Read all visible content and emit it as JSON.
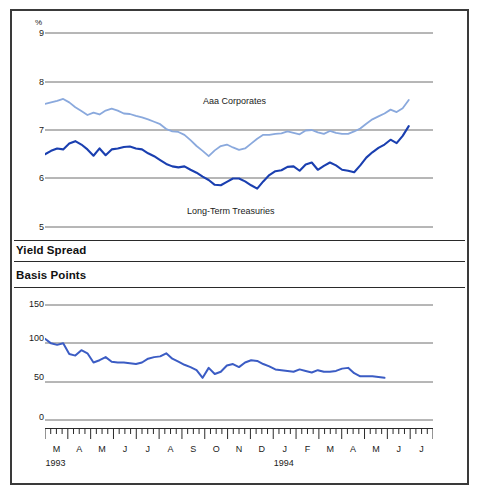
{
  "figure": {
    "background": "#ffffff",
    "frame_color": "#3a3a3a"
  },
  "sections": {
    "yield_spread_heading": "Yield Spread",
    "basis_points_heading": "Basis Points"
  },
  "chart_data": [
    {
      "id": "yields",
      "type": "line",
      "title": "",
      "xlabel": "",
      "ylabel": "%",
      "ylim": [
        5,
        9
      ],
      "yticks": [
        5,
        6,
        7,
        8,
        9
      ],
      "ytick_labels": [
        "5",
        "6",
        "7",
        "8",
        "9"
      ],
      "grid": true,
      "legend_position": "in-plot",
      "xlim": [
        0,
        64
      ],
      "annotations": [
        {
          "text": "Aaa Corporates",
          "x": 25.0,
          "y": 7.62
        },
        {
          "text": "Long-Term Treasuries",
          "x": 25.0,
          "y": 5.38
        }
      ],
      "series": [
        {
          "name": "Aaa Corporates",
          "color": "#8aa9dd",
          "values": [
            7.54,
            7.57,
            7.6,
            7.64,
            7.57,
            7.47,
            7.39,
            7.31,
            7.36,
            7.32,
            7.4,
            7.44,
            7.4,
            7.34,
            7.33,
            7.29,
            7.26,
            7.22,
            7.17,
            7.12,
            7.02,
            6.97,
            6.96,
            6.9,
            6.79,
            6.67,
            6.57,
            6.46,
            6.58,
            6.67,
            6.7,
            6.64,
            6.59,
            6.62,
            6.72,
            6.82,
            6.9,
            6.9,
            6.92,
            6.93,
            6.97,
            6.94,
            6.91,
            6.99,
            7.0,
            6.95,
            6.92,
            6.98,
            6.94,
            6.92,
            6.92,
            6.97,
            7.03,
            7.13,
            7.22,
            7.28,
            7.34,
            7.42,
            7.37,
            7.45,
            7.62
          ]
        },
        {
          "name": "Long-Term Treasuries",
          "color": "#1a3fb0",
          "values": [
            6.5,
            6.57,
            6.62,
            6.6,
            6.72,
            6.77,
            6.7,
            6.6,
            6.47,
            6.62,
            6.48,
            6.6,
            6.62,
            6.65,
            6.66,
            6.62,
            6.6,
            6.52,
            6.46,
            6.38,
            6.3,
            6.25,
            6.23,
            6.25,
            6.18,
            6.12,
            6.04,
            5.97,
            5.87,
            5.86,
            5.93,
            6.0,
            6.0,
            5.94,
            5.86,
            5.79,
            5.94,
            6.07,
            6.15,
            6.17,
            6.24,
            6.25,
            6.16,
            6.29,
            6.33,
            6.18,
            6.26,
            6.33,
            6.27,
            6.18,
            6.16,
            6.13,
            6.27,
            6.43,
            6.54,
            6.63,
            6.7,
            6.8,
            6.73,
            6.88,
            7.08
          ]
        }
      ]
    },
    {
      "id": "yield-spread",
      "type": "line",
      "title": "Basis Points",
      "xlabel": "",
      "ylabel": "Basis Points",
      "ylim": [
        0,
        150
      ],
      "yticks": [
        0,
        50,
        100,
        150
      ],
      "ytick_labels": [
        "0",
        "50",
        "100",
        "150"
      ],
      "grid": true,
      "xlim": [
        0,
        64
      ],
      "series": [
        {
          "name": "Yield Spread",
          "color": "#3b5cc4",
          "values": [
            106,
            100,
            98,
            100,
            86,
            84,
            91,
            87,
            75,
            78,
            82,
            76,
            75,
            75,
            74,
            73,
            75,
            80,
            82,
            83,
            87,
            80,
            76,
            72,
            69,
            65,
            55,
            68,
            60,
            63,
            71,
            73,
            69,
            75,
            78,
            77,
            73,
            70,
            66,
            65,
            64,
            63,
            66,
            64,
            62,
            65,
            63,
            63,
            64,
            67,
            68,
            61,
            57,
            57,
            57,
            56,
            55
          ]
        }
      ]
    }
  ],
  "xaxis": {
    "months": [
      "M",
      "A",
      "M",
      "J",
      "J",
      "A",
      "S",
      "O",
      "N",
      "D",
      "J",
      "F",
      "M",
      "A",
      "M",
      "J",
      "J"
    ],
    "years": [
      {
        "label": "1993",
        "month_index": 0
      },
      {
        "label": "1994",
        "month_index": 10
      }
    ],
    "minor_ticks_per_month": 4
  }
}
